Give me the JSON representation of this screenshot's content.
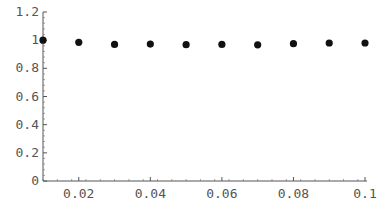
{
  "chart_data": {
    "type": "scatter",
    "title": "",
    "xlabel": "",
    "ylabel": "",
    "xlim": [
      0.01,
      0.1
    ],
    "ylim": [
      0,
      1.2
    ],
    "grid": false,
    "legend": null,
    "x_ticks": [
      0.02,
      0.04,
      0.06,
      0.08,
      0.1
    ],
    "x_tick_labels": [
      "0.02",
      "0.04",
      "0.06",
      "0.08",
      "0.1"
    ],
    "y_ticks": [
      0,
      0.2,
      0.4,
      0.6,
      0.8,
      1,
      1.2
    ],
    "y_tick_labels": [
      "0",
      "0.2",
      "0.4",
      "0.6",
      "0.8",
      "1",
      "1.2"
    ],
    "series": [
      {
        "name": "data",
        "color": "#111111",
        "x": [
          0.01,
          0.02,
          0.03,
          0.04,
          0.05,
          0.06,
          0.07,
          0.08,
          0.09,
          0.1
        ],
        "y": [
          1.0,
          0.985,
          0.97,
          0.972,
          0.968,
          0.97,
          0.967,
          0.975,
          0.98,
          0.98
        ]
      }
    ]
  }
}
